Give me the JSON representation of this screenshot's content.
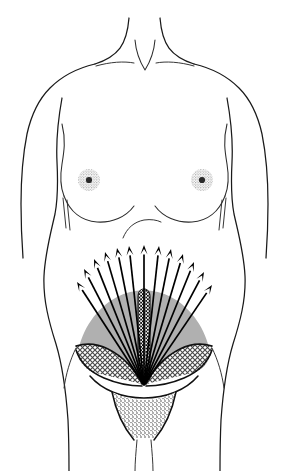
{
  "figure": {
    "view": "anterior",
    "background_color": "#ffffff",
    "ink_color": "#1a1a1a",
    "canvas": {
      "width": 289,
      "height": 471
    }
  },
  "palette": {
    "outline": "#1a1a1a",
    "crease": "#2b2b2b",
    "fan_gray": "#b0b0b0",
    "hatch_dark": "#141414",
    "hatch_light": "#6e6e6e",
    "stipple": "#555555",
    "arrow": "#000000",
    "white": "#ffffff"
  },
  "anatomy": {
    "regions": [
      {
        "name": "neck",
        "label": "Neck"
      },
      {
        "name": "suprasternal-notch",
        "label": "Suprasternal notch"
      },
      {
        "name": "clavicle-left",
        "label": "Left clavicle"
      },
      {
        "name": "clavicle-right",
        "label": "Right clavicle"
      },
      {
        "name": "shoulder-left",
        "label": "Left shoulder"
      },
      {
        "name": "shoulder-right",
        "label": "Right shoulder"
      },
      {
        "name": "breast-left",
        "label": "Left breast"
      },
      {
        "name": "breast-right",
        "label": "Right breast"
      },
      {
        "name": "areola-left",
        "label": "Left areola"
      },
      {
        "name": "areola-right",
        "label": "Right areola"
      },
      {
        "name": "umbilicus",
        "label": "Umbilicus"
      },
      {
        "name": "abdomen",
        "label": "Abdomen"
      },
      {
        "name": "linea-alba",
        "label": "Linea alba"
      },
      {
        "name": "inguinal-left",
        "label": "Left inguinal region"
      },
      {
        "name": "inguinal-right",
        "label": "Right inguinal region"
      },
      {
        "name": "pubic-triangle",
        "label": "Pubic region"
      },
      {
        "name": "hip-left",
        "label": "Left hip"
      },
      {
        "name": "hip-right",
        "label": "Right hip"
      }
    ],
    "areolae": [
      {
        "cx": 89,
        "cy": 180,
        "r": 11
      },
      {
        "cx": 202,
        "cy": 180,
        "r": 11
      }
    ],
    "umbilicus": {
      "cx": 140,
      "cy": 229,
      "r": 5
    }
  },
  "chart_data": {
    "type": "vector-field-diagram",
    "origin": {
      "x": 144,
      "y": 385
    },
    "arrow_count": 13,
    "arrows": [
      {
        "id": 1,
        "side": "left",
        "angle_deg": 201,
        "length": 118,
        "tip_x": 77,
        "tip_y": 282
      },
      {
        "id": 2,
        "side": "left",
        "angle_deg": 208,
        "length": 127,
        "tip_x": 84,
        "tip_y": 269
      },
      {
        "id": 3,
        "side": "left",
        "angle_deg": 216,
        "length": 133,
        "tip_x": 94,
        "tip_y": 259
      },
      {
        "id": 4,
        "side": "left",
        "angle_deg": 224,
        "length": 138,
        "tip_x": 105,
        "tip_y": 252
      },
      {
        "id": 5,
        "side": "left",
        "angle_deg": 232,
        "length": 141,
        "tip_x": 117,
        "tip_y": 248
      },
      {
        "id": 6,
        "side": "left",
        "angle_deg": 241,
        "length": 143,
        "tip_x": 129,
        "tip_y": 246
      },
      {
        "id": 7,
        "side": "center",
        "angle_deg": 270,
        "length": 140,
        "tip_x": 144,
        "tip_y": 245
      },
      {
        "id": 8,
        "side": "right",
        "angle_deg": 299,
        "length": 143,
        "tip_x": 159,
        "tip_y": 246
      },
      {
        "id": 9,
        "side": "right",
        "angle_deg": 308,
        "length": 141,
        "tip_x": 171,
        "tip_y": 249
      },
      {
        "id": 10,
        "side": "right",
        "angle_deg": 316,
        "length": 138,
        "tip_x": 183,
        "tip_y": 254
      },
      {
        "id": 11,
        "side": "right",
        "angle_deg": 324,
        "length": 133,
        "tip_x": 194,
        "tip_y": 262
      },
      {
        "id": 12,
        "side": "right",
        "angle_deg": 332,
        "length": 127,
        "tip_x": 204,
        "tip_y": 272
      },
      {
        "id": 13,
        "side": "right",
        "angle_deg": 339,
        "length": 118,
        "tip_x": 212,
        "tip_y": 285
      }
    ],
    "zones": [
      {
        "name": "fan-gray-zone",
        "label": "Suprapubic drainage field",
        "fill": "#b0b0b0",
        "pattern": "solid"
      },
      {
        "name": "inguinal-left-zone",
        "label": "Left inguinal node field",
        "fill": "#6e6e6e",
        "pattern": "cross-hatch"
      },
      {
        "name": "inguinal-right-zone",
        "label": "Right inguinal node field",
        "fill": "#6e6e6e",
        "pattern": "cross-hatch"
      },
      {
        "name": "linea-alba-band",
        "label": "Midline watershed",
        "fill": "#141414",
        "pattern": "dense-cross-hatch"
      },
      {
        "name": "pubic-zone",
        "label": "Pubic region",
        "fill": "#555555",
        "pattern": "stipple"
      }
    ],
    "legend": [],
    "annotations": [],
    "labels_visible": false
  }
}
